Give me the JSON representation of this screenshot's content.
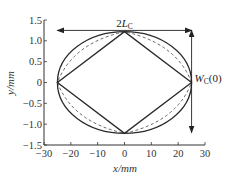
{
  "chart_data": {
    "type": "line",
    "title": "",
    "xlabel": "x/mm",
    "ylabel": "y/mm",
    "xlim": [
      -30,
      30
    ],
    "ylim": [
      -1.5,
      1.5
    ],
    "grid": false,
    "legend": null,
    "x_ticks": [
      -30,
      -20,
      -10,
      0,
      10,
      20,
      30
    ],
    "x_tick_labels": [
      "−30",
      "−20",
      "−10",
      "0",
      "10",
      "20",
      "30"
    ],
    "y_ticks": [
      1.5,
      1.0,
      0.5,
      0,
      -0.5,
      -1.0,
      -1.5
    ],
    "y_tick_labels": [
      "1.5",
      "1.0",
      "0.5",
      "0",
      "−0.5",
      "−1.0",
      "−1.5"
    ],
    "series": [
      {
        "name": "ellipse (outer contour)",
        "style": "solid",
        "shape": "ellipse",
        "center": [
          0,
          0
        ],
        "semi_axis_x": 25,
        "semi_axis_y": 1.22
      },
      {
        "name": "intermediate contour",
        "style": "dashed",
        "shape": "curved-rhombus",
        "vertices": [
          [
            25,
            0
          ],
          [
            0,
            1.22
          ],
          [
            -25,
            0
          ],
          [
            0,
            -1.22
          ]
        ]
      },
      {
        "name": "rhombus (inner contour)",
        "style": "solid",
        "shape": "polygon",
        "x": [
          25,
          0,
          -25,
          0,
          25
        ],
        "y": [
          0,
          1.22,
          0,
          -1.22,
          0
        ]
      }
    ],
    "annotations": [
      {
        "text": "2L_C",
        "display_main": "2",
        "display_italic": "L",
        "display_sub": "C",
        "type": "double-arrow-horizontal",
        "from": [
          -25,
          1.25
        ],
        "to": [
          25,
          1.25
        ]
      },
      {
        "text": "W_C(0)",
        "display_italic": "W",
        "display_sub": "C",
        "display_suffix": "(0)",
        "type": "double-arrow-vertical",
        "from": [
          25,
          1.25
        ],
        "to": [
          25,
          -1.2
        ]
      }
    ]
  }
}
